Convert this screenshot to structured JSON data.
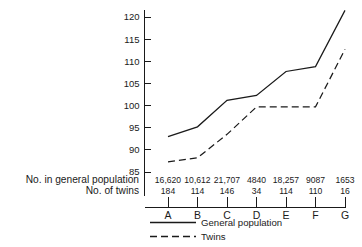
{
  "chart_data": {
    "type": "line",
    "title": "",
    "subtitle": "",
    "xlabel": "",
    "ylabel": "",
    "categories": [
      "A",
      "B",
      "C",
      "D",
      "E",
      "F",
      "G"
    ],
    "ylim": [
      83,
      122.5
    ],
    "yticks": [
      85,
      90,
      95,
      100,
      105,
      110,
      115,
      120
    ],
    "ytick_labels": [
      "85",
      "90",
      "95",
      "100",
      "105",
      "110",
      "115",
      "120"
    ],
    "grid": false,
    "legend_position": "bottom-left",
    "series": [
      {
        "name": "General population",
        "style": "solid",
        "color": "#1a1a1a",
        "values": [
          93.0,
          95.2,
          101.2,
          102.3,
          107.7,
          108.8,
          121.5
        ]
      },
      {
        "name": "Twins",
        "style": "dashed",
        "color": "#1a1a1a",
        "values": [
          87.3,
          88.2,
          93.5,
          99.7,
          99.7,
          99.7,
          112.7
        ]
      }
    ],
    "annotation_rows": [
      {
        "label": "No. in general population",
        "values": [
          "16,620",
          "10,612",
          "21,707",
          "4840",
          "18,257",
          "9087",
          "1653"
        ]
      },
      {
        "label": "No. of twins",
        "values": [
          "184",
          "114",
          "146",
          "34",
          "114",
          "110",
          "16"
        ]
      }
    ]
  },
  "legend": {
    "items": [
      {
        "label": "General population",
        "style": "solid"
      },
      {
        "label": "Twins",
        "style": "dashed"
      }
    ]
  }
}
